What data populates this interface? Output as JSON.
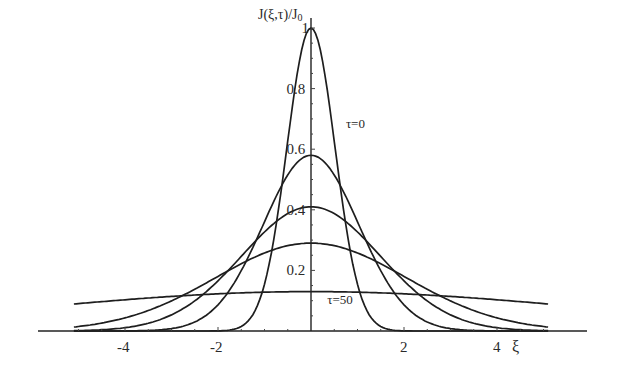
{
  "chart_data": {
    "type": "line",
    "title": "",
    "xlabel": "ξ",
    "ylabel": "J(ξ,τ)/J0",
    "xlim": [
      -5.1,
      5.1
    ],
    "ylim": [
      0,
      1.0
    ],
    "x_ticks": [
      -4,
      -2,
      2,
      4
    ],
    "x_tick_labels": [
      "-4",
      "-2",
      "2",
      "4"
    ],
    "y_ticks": [
      0.2,
      0.4,
      0.6,
      0.8,
      1
    ],
    "y_tick_labels": [
      "0.2",
      "0.4",
      "0.6",
      "0.8",
      "1"
    ],
    "grid": false,
    "legend": "none (inline annotations)",
    "annotations": [
      {
        "text": "τ=0",
        "x": 0.75,
        "y": 0.67
      },
      {
        "text": "τ=50",
        "x": 0.35,
        "y": 0.09
      }
    ],
    "series": [
      {
        "name": "τ=0",
        "peak": 1.0,
        "x": [
          -5,
          -3,
          -2,
          -1.5,
          -1,
          -0.5,
          0,
          0.5,
          1,
          1.5,
          2,
          3,
          5
        ],
        "values": [
          0.0,
          0.0,
          0.01,
          0.05,
          0.26,
          0.72,
          1.0,
          0.72,
          0.26,
          0.05,
          0.01,
          0.0,
          0.0
        ]
      },
      {
        "name": "intermediate-1",
        "peak": 0.58,
        "x": [
          -5,
          -4,
          -3,
          -2,
          -1,
          0,
          1,
          2,
          3,
          4,
          5
        ],
        "values": [
          0.0,
          0.01,
          0.04,
          0.15,
          0.42,
          0.58,
          0.42,
          0.15,
          0.04,
          0.01,
          0.0
        ]
      },
      {
        "name": "intermediate-2",
        "peak": 0.41,
        "x": [
          -5,
          -4,
          -3,
          -2,
          -1,
          0,
          1,
          2,
          3,
          4,
          5
        ],
        "values": [
          0.01,
          0.03,
          0.09,
          0.2,
          0.34,
          0.41,
          0.34,
          0.2,
          0.09,
          0.03,
          0.01
        ]
      },
      {
        "name": "intermediate-3",
        "peak": 0.29,
        "x": [
          -5,
          -4,
          -3,
          -2,
          -1,
          0,
          1,
          2,
          3,
          4,
          5
        ],
        "values": [
          0.03,
          0.07,
          0.13,
          0.2,
          0.26,
          0.29,
          0.26,
          0.2,
          0.13,
          0.07,
          0.03
        ]
      },
      {
        "name": "τ=50",
        "peak": 0.13,
        "x": [
          -5,
          -4,
          -3,
          -2,
          -1,
          0,
          1,
          2,
          3,
          4,
          5
        ],
        "values": [
          0.08,
          0.095,
          0.11,
          0.12,
          0.128,
          0.13,
          0.128,
          0.12,
          0.11,
          0.095,
          0.08
        ]
      }
    ]
  },
  "axis": {
    "y_title": "J(ξ,τ)/J",
    "y_title_sub": "0",
    "x_title": "ξ"
  }
}
